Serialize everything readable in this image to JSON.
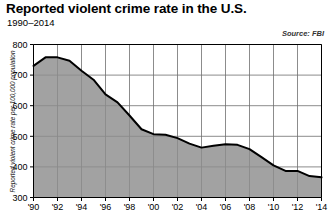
{
  "chart_data": {
    "type": "area",
    "title": "Reported violent crime rate in the U.S.",
    "subtitle": "1990–2014",
    "source": "Source: FBI",
    "xlabel": "",
    "ylabel": "Reported violent crime rate per 100,000 population",
    "ylim": [
      300,
      800
    ],
    "xlim": [
      1990,
      2014
    ],
    "yticks": [
      300,
      400,
      500,
      600,
      700,
      800
    ],
    "ytick_labels": [
      "300",
      "400",
      "500",
      "600",
      "700",
      "800"
    ],
    "xticks": [
      1990,
      1992,
      1994,
      1996,
      1998,
      2000,
      2002,
      2004,
      2006,
      2008,
      2010,
      2012,
      2014
    ],
    "xtick_labels": [
      "'90",
      "'92",
      "'94",
      "'96",
      "'98",
      "'00",
      "'02",
      "'04",
      "'06",
      "'08",
      "'10",
      "'12",
      "'14"
    ],
    "grid": true,
    "legend": false,
    "x": [
      1990,
      1991,
      1992,
      1993,
      1994,
      1995,
      1996,
      1997,
      1998,
      1999,
      2000,
      2001,
      2002,
      2003,
      2004,
      2005,
      2006,
      2007,
      2008,
      2009,
      2010,
      2011,
      2012,
      2013,
      2014
    ],
    "values": [
      730,
      758,
      758,
      747,
      714,
      685,
      637,
      611,
      568,
      523,
      507,
      505,
      494,
      476,
      463,
      469,
      474,
      472,
      458,
      432,
      405,
      387,
      387,
      370,
      366
    ],
    "series": [
      {
        "name": "Violent crime rate",
        "values": [
          730,
          758,
          758,
          747,
          714,
          685,
          637,
          611,
          568,
          523,
          507,
          505,
          494,
          476,
          463,
          469,
          474,
          472,
          458,
          432,
          405,
          387,
          387,
          370,
          366
        ]
      }
    ],
    "colors": {
      "fill": "#8d8d8d",
      "line": "#000000",
      "grid": "#6e6e6e",
      "axis": "#000000",
      "background": "#ffffff"
    }
  }
}
